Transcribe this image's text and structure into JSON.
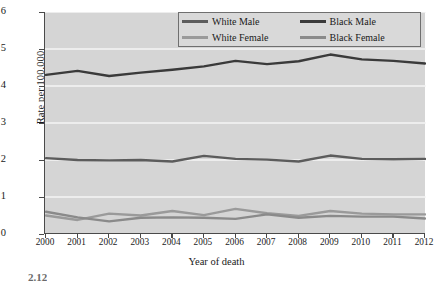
{
  "chart_data": {
    "type": "line",
    "title": "",
    "xlabel": "Year of death",
    "ylabel": "Rate per 100,000",
    "x": [
      2000,
      2001,
      2002,
      2003,
      2004,
      2005,
      2006,
      2007,
      2008,
      2009,
      2010,
      2011,
      2012
    ],
    "xlim": [
      2000,
      2012
    ],
    "ylim": [
      0,
      6
    ],
    "yticks": [
      0,
      1,
      2,
      3,
      4,
      5,
      6
    ],
    "xticks": [
      "2000",
      "2001",
      "2002",
      "2003",
      "2004",
      "2005",
      "2006",
      "2007",
      "2008",
      "2009",
      "2010",
      "2011",
      "2012"
    ],
    "grid": "horizontal-white",
    "legend_position": "top-right",
    "series": [
      {
        "name": "White Male",
        "color": "#5c5c5c",
        "values": [
          2.05,
          2.0,
          1.99,
          2.0,
          1.96,
          2.11,
          2.03,
          2.01,
          1.96,
          2.12,
          2.03,
          2.02,
          2.03
        ]
      },
      {
        "name": "White Female",
        "color": "#9a9a9a",
        "values": [
          0.5,
          0.38,
          0.55,
          0.5,
          0.62,
          0.51,
          0.68,
          0.56,
          0.49,
          0.62,
          0.55,
          0.53,
          0.53
        ]
      },
      {
        "name": "Black Male",
        "color": "#3a3a3a",
        "values": [
          4.3,
          4.41,
          4.27,
          4.36,
          4.44,
          4.53,
          4.68,
          4.59,
          4.67,
          4.85,
          4.72,
          4.68,
          4.61
        ]
      },
      {
        "name": "Black Female",
        "color": "#8a8a8a",
        "values": [
          0.6,
          0.45,
          0.34,
          0.44,
          0.45,
          0.44,
          0.41,
          0.53,
          0.44,
          0.49,
          0.47,
          0.47,
          0.42
        ]
      }
    ]
  },
  "legend": {
    "entries": [
      {
        "label": "White Male",
        "color": "#5c5c5c"
      },
      {
        "label": "Black Male",
        "color": "#3a3a3a"
      },
      {
        "label": "White Female",
        "color": "#9a9a9a"
      },
      {
        "label": "Black Female",
        "color": "#8a8a8a"
      }
    ]
  },
  "footer": {
    "fragment": "2.12"
  },
  "colors": {
    "plot_background": "#d5d5d5",
    "gridline": "#f4f4f4",
    "axis": "#4a4a4a"
  }
}
